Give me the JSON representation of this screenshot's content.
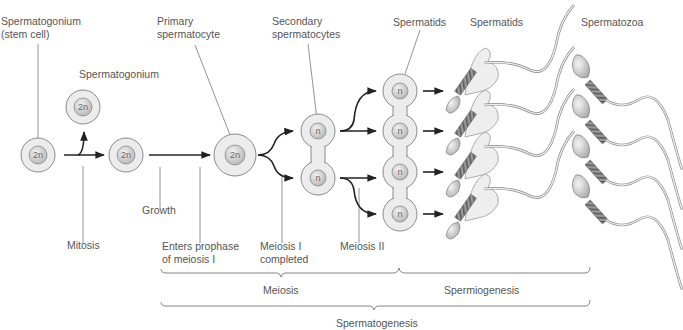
{
  "figure": {
    "colors": {
      "cell_outer": "#ececec",
      "cell_stroke": "#8a8a8a",
      "nucleus": "#c9c9c9",
      "line": "#222222",
      "label_text": "#555555",
      "leader_line": "#777777"
    }
  },
  "labels": {
    "stem_cell": [
      "Spermatogonium",
      "(stem cell)"
    ],
    "spermatogonium": "Spermatogonium",
    "primary": [
      "Primary",
      "spermatocyte"
    ],
    "secondary": [
      "Secondary",
      "spermatocytes"
    ],
    "spermatids_1": "Spermatids",
    "spermatids_2": "Spermatids",
    "spermatozoa": "Spermatozoa",
    "mitosis": "Mitosis",
    "growth": "Growth",
    "enters_prophase": [
      "Enters prophase",
      "of meiosis I"
    ],
    "meiosis_i": [
      "Meiosis I",
      "completed"
    ],
    "meiosis_ii": "Meiosis II",
    "meiosis": "Meiosis",
    "spermiogenesis": "Spermiogenesis",
    "spermatogenesis": "Spermatogenesis"
  },
  "cells": {
    "stem": "2n",
    "spermatogonium": "2n",
    "daughter": "2n",
    "primary": "2n",
    "secondary": [
      "n",
      "n"
    ],
    "spermatids": [
      "n",
      "n",
      "n",
      "n"
    ]
  }
}
